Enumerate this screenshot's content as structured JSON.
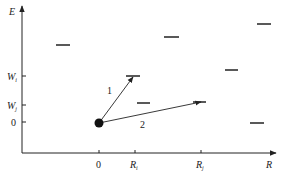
{
  "diagram": {
    "axes": {
      "y_label": "E",
      "x_label": "R",
      "y_ticks": [
        {
          "main": "W",
          "sub": "i",
          "y": 76
        },
        {
          "main": "W",
          "sub": "j",
          "y": 105
        },
        {
          "main": "0",
          "sub": "",
          "y": 122
        }
      ],
      "x_ticks": [
        {
          "main": "0",
          "sub": "",
          "x": 99
        },
        {
          "main": "R",
          "sub": "i",
          "x": 135
        },
        {
          "main": "R",
          "sub": "j",
          "x": 201
        }
      ]
    },
    "arrows": [
      {
        "label": "1",
        "from": [
          99,
          123
        ],
        "to": [
          133,
          76
        ]
      },
      {
        "label": "2",
        "from": [
          99,
          123
        ],
        "to": [
          200,
          102
        ]
      }
    ],
    "levels": [
      {
        "x1": 56,
        "x2": 70,
        "y": 45
      },
      {
        "x1": 164,
        "x2": 179,
        "y": 37
      },
      {
        "x1": 257,
        "x2": 271,
        "y": 24
      },
      {
        "x1": 126,
        "x2": 140,
        "y": 76
      },
      {
        "x1": 137,
        "x2": 150,
        "y": 103
      },
      {
        "x1": 193,
        "x2": 206,
        "y": 102
      },
      {
        "x1": 225,
        "x2": 238,
        "y": 70
      },
      {
        "x1": 250,
        "x2": 264,
        "y": 123
      }
    ],
    "colors": {
      "ink": "#222222"
    }
  }
}
